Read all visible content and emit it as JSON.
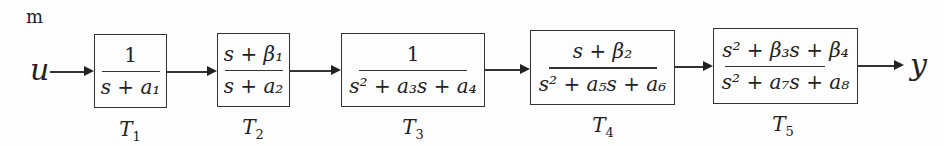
{
  "diagram": {
    "type": "block-diagram-cascade",
    "corner_label": "m",
    "input_signal": "u",
    "output_signal": "y",
    "blocks": [
      {
        "name": "T1",
        "label": "T",
        "sub": "1",
        "numerator": "1",
        "denominator": "s + a₁"
      },
      {
        "name": "T2",
        "label": "T",
        "sub": "2",
        "numerator": "s + β₁",
        "denominator": "s + a₂"
      },
      {
        "name": "T3",
        "label": "T",
        "sub": "3",
        "numerator": "1",
        "denominator": "s² + a₃s + a₄"
      },
      {
        "name": "T4",
        "label": "T",
        "sub": "4",
        "numerator": "s + β₂",
        "denominator": "s² + a₅s + a₆"
      },
      {
        "name": "T5",
        "label": "T",
        "sub": "5",
        "numerator": "s² + β₃s + β₄",
        "denominator": "s² + a₇s + a₈"
      }
    ]
  }
}
